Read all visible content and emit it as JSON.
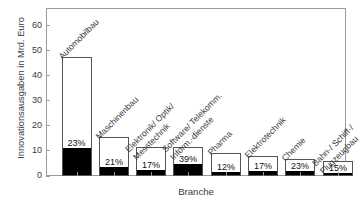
{
  "chart_data": {
    "type": "bar",
    "title": "",
    "xlabel": "Branche",
    "ylabel": "Innovationsausgaben in Mrd. Euro",
    "ylim": [
      0,
      67
    ],
    "yticks": [
      0,
      10,
      20,
      30,
      40,
      50,
      60
    ],
    "ytick_labels": [
      "0",
      "10",
      "20",
      "30",
      "40",
      "50",
      "60"
    ],
    "grid": false,
    "legend": null,
    "categories": [
      "Automobilbau",
      "Maschinenbau",
      "Elektronik/ Optik/ Messtechnik",
      "Software/ Telekomm. Inform.-dienste",
      "Pharma",
      "Elektrotechnik",
      "Chemie",
      "Bahn-/ Schiff-/ Flugzeugbau"
    ],
    "category_lines": [
      [
        "Automobilbau"
      ],
      [
        "Maschinenbau"
      ],
      [
        "Elektronik/ Optik/",
        "Messtechnik"
      ],
      [
        "Software/ Telekomm.",
        "Inform.-dienste"
      ],
      [
        "Pharma"
      ],
      [
        "Elektrotechnik"
      ],
      [
        "Chemie"
      ],
      [
        "Bahn-/ Schiff-/",
        "Flugzeugbau"
      ]
    ],
    "series": [
      {
        "name": "Innovationsausgaben gesamt",
        "values": [
          47.3,
          15.4,
          11.6,
          11.5,
          9.0,
          8.0,
          6.9,
          5.8
        ]
      },
      {
        "name": "davon FuE-Anteil (schwarz)",
        "values": [
          10.9,
          3.2,
          2.0,
          4.5,
          1.1,
          1.4,
          1.6,
          0.9
        ]
      }
    ],
    "data_labels": [
      "23%",
      "21%",
      "17%",
      "39%",
      "12%",
      "17%",
      "23%",
      "15%"
    ],
    "colors": {
      "bar_fill": "#ffffff",
      "bar_edge": "#555555",
      "bar_inner": "#000000",
      "axis": "#9a9a9a",
      "text": "#3a3a3a",
      "background": "#ffffff"
    }
  }
}
